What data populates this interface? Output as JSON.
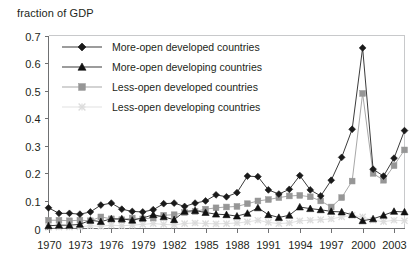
{
  "chart_data": {
    "type": "line",
    "title": "fraction of GDP",
    "xlabel": "",
    "ylabel": "",
    "ylim": [
      0,
      0.7
    ],
    "ytick_labels": [
      "0",
      "0.1",
      "0.2",
      "0.3",
      "0.4",
      "0.5",
      "0.6",
      "0.7"
    ],
    "ytick_values": [
      0,
      0.1,
      0.2,
      0.3,
      0.4,
      0.5,
      0.6,
      0.7
    ],
    "xlim": [
      1970,
      2004
    ],
    "xtick_labels": [
      "1970",
      "1973",
      "1976",
      "1979",
      "1982",
      "1985",
      "1988",
      "1991",
      "1994",
      "1997",
      "2000",
      "2003"
    ],
    "xtick_values": [
      1970,
      1973,
      1976,
      1979,
      1982,
      1985,
      1988,
      1991,
      1994,
      1997,
      2000,
      2003
    ],
    "grid": false,
    "legend_position": "upper-left-inside",
    "x": [
      1970,
      1971,
      1972,
      1973,
      1974,
      1975,
      1976,
      1977,
      1978,
      1979,
      1980,
      1981,
      1982,
      1983,
      1984,
      1985,
      1986,
      1987,
      1988,
      1989,
      1990,
      1991,
      1992,
      1993,
      1994,
      1995,
      1996,
      1997,
      1998,
      1999,
      2000,
      2001,
      2002,
      2003,
      2004
    ],
    "series": [
      {
        "name": "More-open developed countries",
        "marker": "diamond",
        "color": "#1a1a1a",
        "line_color": "#3b3b3b",
        "values": [
          0.075,
          0.055,
          0.055,
          0.052,
          0.06,
          0.085,
          0.092,
          0.07,
          0.062,
          0.06,
          0.068,
          0.09,
          0.092,
          0.08,
          0.092,
          0.1,
          0.122,
          0.115,
          0.13,
          0.19,
          0.188,
          0.14,
          0.125,
          0.142,
          0.192,
          0.14,
          0.118,
          0.175,
          0.258,
          0.36,
          0.655,
          0.215,
          0.19,
          0.255,
          0.355
        ]
      },
      {
        "name": "More-open developing countries",
        "marker": "triangle",
        "color": "#111111",
        "line_color": "#3b3b3b",
        "values": [
          0.01,
          0.012,
          0.012,
          0.015,
          0.03,
          0.025,
          0.035,
          0.035,
          0.03,
          0.038,
          0.05,
          0.042,
          0.032,
          0.062,
          0.065,
          0.058,
          0.052,
          0.05,
          0.045,
          0.055,
          0.075,
          0.05,
          0.04,
          0.048,
          0.078,
          0.072,
          0.068,
          0.062,
          0.06,
          0.05,
          0.028,
          0.035,
          0.048,
          0.062,
          0.06
        ]
      },
      {
        "name": "Less-open developed countries",
        "marker": "square",
        "color": "#969696",
        "line_color": "#a8a8a8",
        "values": [
          0.03,
          0.03,
          0.028,
          0.03,
          0.028,
          0.042,
          0.035,
          0.032,
          0.038,
          0.035,
          0.038,
          0.048,
          0.05,
          0.058,
          0.062,
          0.07,
          0.075,
          0.078,
          0.08,
          0.09,
          0.1,
          0.105,
          0.112,
          0.118,
          0.12,
          0.115,
          0.1,
          0.078,
          0.112,
          0.172,
          0.49,
          0.2,
          0.175,
          0.228,
          0.285
        ]
      },
      {
        "name": "Less-open developing countries",
        "marker": "cross",
        "color": "#dcdcdc",
        "line_color": "#e2e2e2",
        "values": [
          0.004,
          0.005,
          0.005,
          0.006,
          0.01,
          0.008,
          0.012,
          0.01,
          0.012,
          0.015,
          0.018,
          0.015,
          0.013,
          0.018,
          0.02,
          0.018,
          0.017,
          0.018,
          0.02,
          0.024,
          0.03,
          0.022,
          0.018,
          0.02,
          0.028,
          0.03,
          0.032,
          0.035,
          0.042,
          0.048,
          0.042,
          0.03,
          0.025,
          0.03,
          0.028
        ]
      }
    ]
  }
}
